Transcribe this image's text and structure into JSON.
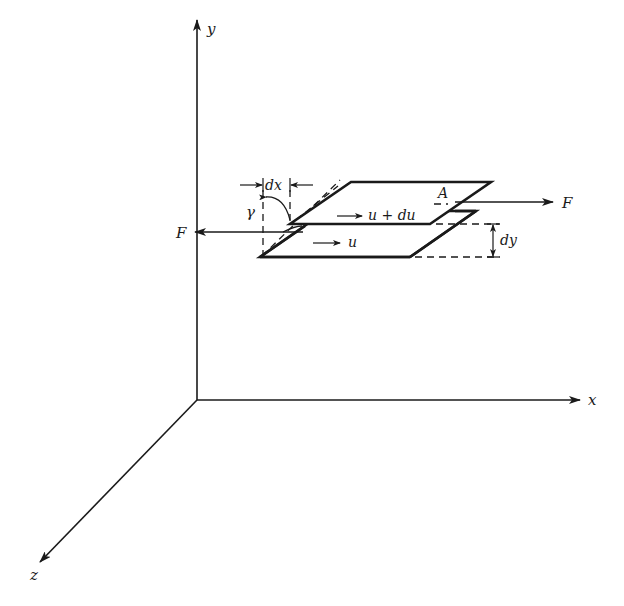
{
  "diagram": {
    "type": "shear-deformation-between-parallel-plates",
    "axes": {
      "x_label": "x",
      "y_label": "y",
      "z_label": "z"
    },
    "labels": {
      "force_right": "F",
      "force_left": "F",
      "area": "A",
      "top_velocity": "u + du",
      "bottom_velocity": "u",
      "shear_angle": "γ",
      "dx": "dx",
      "dy": "dy"
    },
    "colors": {
      "ink": "#1a1a1a",
      "background": "#ffffff"
    }
  }
}
